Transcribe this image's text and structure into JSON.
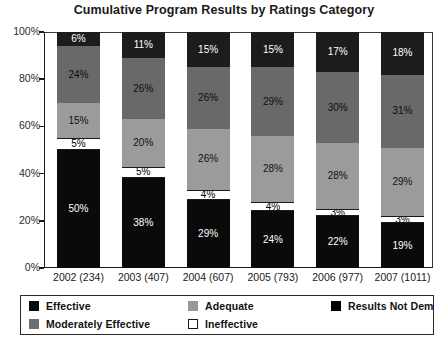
{
  "chart_data": {
    "type": "bar",
    "subtype": "stacked-100-percent",
    "title": "Cumulative Program Results by Ratings Category",
    "xlabel": "",
    "ylabel": "",
    "ylim": [
      0,
      100
    ],
    "yticks": [
      "0%",
      "20%",
      "40%",
      "60%",
      "80%",
      "100%"
    ],
    "ytick_values": [
      0,
      20,
      40,
      60,
      80,
      100
    ],
    "grid": false,
    "legend_position": "bottom",
    "categories": [
      "2002 (234)",
      "2003 (407)",
      "2004 (607)",
      "2005 (793)",
      "2006 (977)",
      "2007 (1011)"
    ],
    "series": [
      {
        "name": "Effective",
        "color": "#0a0a0a",
        "text_color": "#ffffff",
        "values": [
          50,
          38,
          29,
          24,
          22,
          19
        ],
        "labels": [
          "50%",
          "38%",
          "29%",
          "24%",
          "22%",
          "19%"
        ]
      },
      {
        "name": "Ineffective",
        "color": "#ffffff",
        "text_color": "#000000",
        "values": [
          5,
          5,
          4,
          4,
          3,
          3
        ],
        "labels": [
          "5%",
          "5%",
          "4%",
          "4%",
          "3%",
          "3%"
        ]
      },
      {
        "name": "Moderately Effective",
        "color": "#9b9b9b",
        "text_color": "#111111",
        "values": [
          15,
          20,
          26,
          28,
          28,
          29
        ],
        "labels": [
          "15%",
          "20%",
          "26%",
          "28%",
          "28%",
          "29%"
        ]
      },
      {
        "name": "Adequate",
        "color": "#696969",
        "text_color": "#0d0d0d",
        "values": [
          24,
          26,
          26,
          29,
          30,
          31
        ],
        "labels": [
          "24%",
          "26%",
          "26%",
          "29%",
          "30%",
          "31%"
        ]
      },
      {
        "name": "Results Not Demonstrated",
        "color": "#1c1c1c",
        "text_color": "#ffffff",
        "values": [
          6,
          11,
          15,
          15,
          17,
          18
        ],
        "labels": [
          "6%",
          "11%",
          "15%",
          "15%",
          "17%",
          "18%"
        ]
      }
    ]
  },
  "legend": {
    "items": [
      {
        "label": "Effective",
        "swatch": "eff"
      },
      {
        "label": "Adequate",
        "swatch": "adequate"
      },
      {
        "label": "Results Not Demonstrated",
        "swatch": "rnd"
      },
      {
        "label": "Moderately Effective",
        "swatch": "modeff"
      },
      {
        "label": "Ineffective",
        "swatch": "ineff"
      }
    ]
  }
}
